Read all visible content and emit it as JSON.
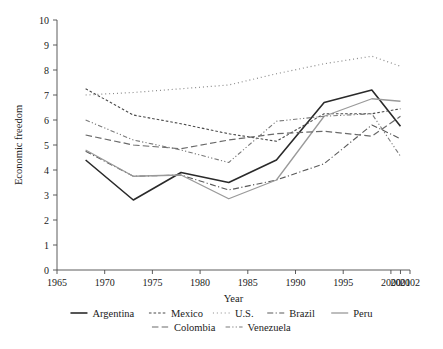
{
  "chart_data": {
    "type": "line",
    "title": "",
    "xlabel": "Year",
    "ylabel": "Economic freedom",
    "xlim": [
      1965,
      2002
    ],
    "ylim": [
      0,
      10
    ],
    "grid": false,
    "legend_position": "bottom",
    "xticks": [
      "1965",
      "1970",
      "1975",
      "1980",
      "1985",
      "1990",
      "1995",
      "2000",
      "2001",
      "2002"
    ],
    "xtick_values": [
      1965,
      1970,
      1975,
      1980,
      1985,
      1990,
      1995,
      2000,
      2001,
      2002
    ],
    "yticks": [
      "0",
      "1",
      "2",
      "3",
      "4",
      "5",
      "6",
      "7",
      "8",
      "9",
      "10"
    ],
    "ytick_values": [
      0,
      1,
      2,
      3,
      4,
      5,
      6,
      7,
      8,
      9,
      10
    ],
    "x": [
      1968,
      1973,
      1978,
      1983,
      1988,
      1993,
      1998,
      2001
    ],
    "series": [
      {
        "name": "Argentina",
        "style": "solid",
        "color": "#2a2a2a",
        "width": 1.6,
        "values": [
          4.4,
          2.8,
          3.9,
          3.5,
          4.4,
          6.7,
          7.2,
          5.75
        ]
      },
      {
        "name": "Mexico",
        "style": "dashed-short",
        "color": "#4a4a4a",
        "width": 1.1,
        "values": [
          7.25,
          6.2,
          5.85,
          5.45,
          5.15,
          6.25,
          6.25,
          6.45
        ]
      },
      {
        "name": "U.S.",
        "style": "dotted",
        "color": "#8a8a8a",
        "width": 1.2,
        "values": [
          7.0,
          7.1,
          7.25,
          7.4,
          7.85,
          8.25,
          8.55,
          8.15
        ]
      },
      {
        "name": "Brazil",
        "style": "dash-dot",
        "color": "#5a5a5a",
        "width": 1.1,
        "values": [
          4.75,
          3.75,
          3.8,
          3.2,
          3.6,
          4.25,
          5.8,
          5.25
        ]
      },
      {
        "name": "Peru",
        "style": "solid",
        "color": "#9a9a9a",
        "width": 1.3,
        "values": [
          4.8,
          3.75,
          3.8,
          2.85,
          3.6,
          6.15,
          6.85,
          6.75
        ]
      },
      {
        "name": "Colombia",
        "style": "dashed-long",
        "color": "#6a6a6a",
        "width": 1.2,
        "values": [
          5.4,
          5.0,
          4.85,
          5.2,
          5.45,
          5.55,
          5.35,
          6.15
        ]
      },
      {
        "name": "Venezuela",
        "style": "dash-dot-dot",
        "color": "#7a7a7a",
        "width": 1.1,
        "values": [
          6.0,
          5.2,
          4.8,
          4.3,
          5.95,
          6.15,
          6.25,
          4.55
        ]
      }
    ],
    "legend_rows": [
      [
        "Argentina",
        "Mexico",
        "U.S.",
        "Brazil",
        "Peru"
      ],
      [
        "Colombia",
        "Venezuela"
      ]
    ]
  }
}
